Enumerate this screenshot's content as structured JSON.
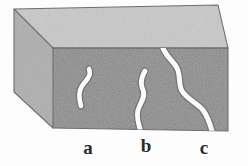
{
  "figure": {
    "kind": "3d-block-crack-diagram",
    "background_color": "#fdfdfd",
    "caption_labels": [
      {
        "id": "a",
        "text": "a",
        "description": "internal crack fully enclosed in the block"
      },
      {
        "id": "b",
        "text": "b",
        "description": "crack reaching the bottom surface"
      },
      {
        "id": "c",
        "text": "c",
        "description": "through crack spanning top to bottom surface"
      }
    ]
  },
  "block": {
    "top_face_color": "#c9c9c9",
    "left_face_color": "#aeaeae",
    "front_face_color": "#8b8b8b",
    "edge_color": "#6f6f6f",
    "top_face_points": "14,9 218,5 228,48 53,48",
    "left_face_points": "14,9 53,48 53,128 14,92",
    "front_face_points": "53,48 228,48 228,131 53,128"
  },
  "cracks": {
    "color": "#fbfbfb",
    "shadow_color": "#5d5d5d",
    "items": [
      {
        "id": "crack-a",
        "label": "a",
        "type": "internal",
        "stroke_width": 4.6,
        "path": "M 89 69 C 92 76, 86 80, 82 86 C 78 92, 79 99, 81 106"
      },
      {
        "id": "crack-b",
        "label": "b",
        "type": "surface-reaching",
        "stroke_width": 4.8,
        "path": "M 145 71 C 141 78, 140 84, 143 90 C 146 97, 140 103, 138 110 C 136 118, 139 124, 140 129"
      },
      {
        "id": "crack-c",
        "label": "c",
        "type": "through",
        "stroke_width": 5.0,
        "path": "M 163 48 C 166 56, 173 61, 177 68 C 181 76, 178 84, 182 91 C 187 99, 197 103, 203 110 C 208 117, 210 124, 212 131"
      }
    ]
  }
}
